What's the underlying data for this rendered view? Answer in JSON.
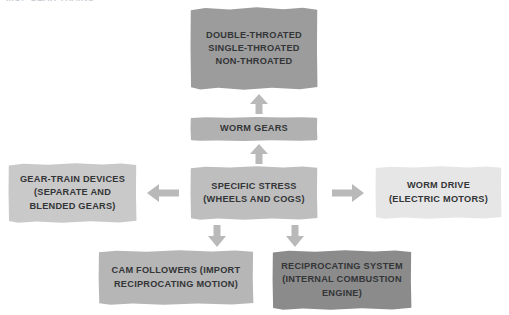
{
  "page": {
    "cropped_header_text": "...OF GEAR TRAINS",
    "background_color": "#ffffff",
    "text_color": "#333537",
    "arrow_color": "#b9b9b9"
  },
  "diagram": {
    "type": "hub-and-spoke flowchart",
    "nodes": [
      {
        "id": "throated-types",
        "lines": [
          "DOUBLE-THROATED",
          "SINGLE-THROATED",
          "NON-THROATED"
        ],
        "color": "#9c9c9c",
        "font_size": "9.2px"
      },
      {
        "id": "worm-gears",
        "lines": [
          "WORM GEARS"
        ],
        "color": "#b1b1b1",
        "font_size": "9.2px"
      },
      {
        "id": "specific-stress",
        "lines": [
          "SPECIFIC STRESS",
          "(WHEELS AND COGS)"
        ],
        "color": "#bebebe",
        "font_size": "9.2px"
      },
      {
        "id": "gear-train-devices",
        "lines": [
          "GEAR-TRAIN DEVICES",
          "(SEPARATE AND",
          "BLENDED GEARS)"
        ],
        "color": "#c9c9c9",
        "font_size": "9.2px"
      },
      {
        "id": "worm-drive",
        "lines": [
          "WORM DRIVE",
          "(ELECTRIC MOTORS)"
        ],
        "color": "#e6e6e6",
        "font_size": "9.2px"
      },
      {
        "id": "cam-followers",
        "lines": [
          "CAM FOLLOWERS (IMPORT",
          "RECIPROCATING MOTION)"
        ],
        "color": "#b6b6b6",
        "font_size": "9.2px"
      },
      {
        "id": "reciprocating-system",
        "lines": [
          "RECIPROCATING SYSTEM",
          "(INTERNAL COMBUSTION",
          "ENGINE)"
        ],
        "color": "#8b8b8b",
        "font_size": "9.2px"
      }
    ],
    "connectors": [
      {
        "id": "worm-gears-to-throated",
        "direction": "up",
        "from": "worm-gears",
        "to": "throated-types"
      },
      {
        "id": "center-to-worm-gears",
        "direction": "up",
        "from": "specific-stress",
        "to": "worm-gears"
      },
      {
        "id": "center-to-gear-train",
        "direction": "left",
        "from": "specific-stress",
        "to": "gear-train-devices"
      },
      {
        "id": "center-to-worm-drive",
        "direction": "right",
        "from": "specific-stress",
        "to": "worm-drive"
      },
      {
        "id": "center-to-cam",
        "direction": "down",
        "from": "specific-stress",
        "to": "cam-followers"
      },
      {
        "id": "center-to-reciprocating",
        "direction": "down",
        "from": "specific-stress",
        "to": "reciprocating-system"
      }
    ]
  }
}
